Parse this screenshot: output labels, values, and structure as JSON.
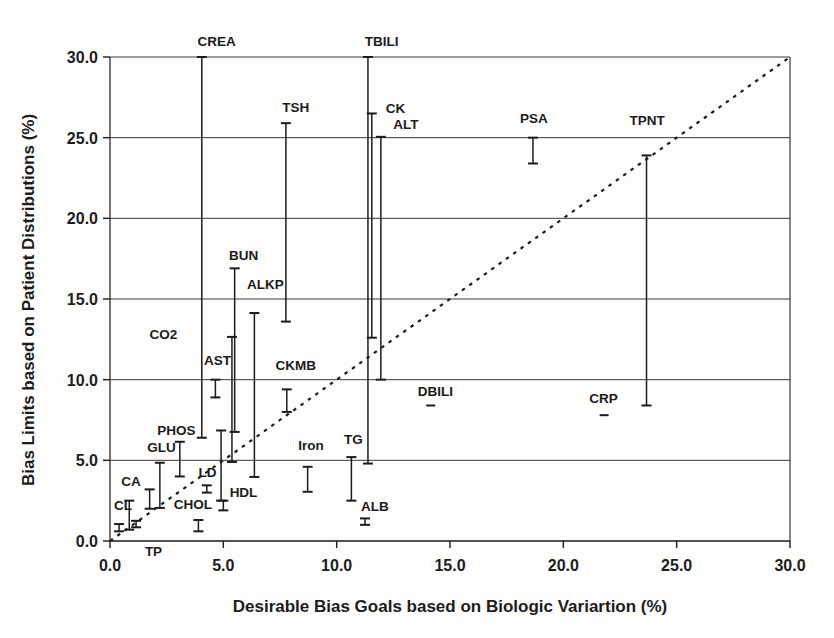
{
  "figure": {
    "background": "#fdfdfc",
    "ink": "#1c1c1c",
    "grid_color": "#3a3a3a"
  },
  "chart_data": {
    "type": "scatter",
    "subtype": "vertical-error-bars",
    "title": "",
    "xlabel": "Desirable Bias Goals based on Biologic Variartion (%)",
    "ylabel": "Bias Limits based on Patient Distributions (%)",
    "xlim": [
      0,
      30
    ],
    "ylim": [
      0,
      30
    ],
    "xtick_values": [
      0,
      5,
      10,
      15,
      20,
      25,
      30
    ],
    "xtick_labels": [
      "0.0",
      "5.0",
      "10.0",
      "15.0",
      "20.0",
      "25.0",
      "30.0"
    ],
    "ytick_values": [
      0,
      5,
      10,
      15,
      20,
      25,
      30
    ],
    "ytick_labels": [
      "0.0",
      "5.0",
      "10.0",
      "15.0",
      "20.0",
      "25.0",
      "30.0"
    ],
    "grid": "horizontal-only",
    "plot_box": true,
    "identity_line": {
      "style": "dashed",
      "from": [
        0,
        0
      ],
      "to": [
        30,
        30
      ]
    },
    "series": [
      {
        "label": "CREA",
        "x": 4.05,
        "y_low": 6.4,
        "y_high": 30.0,
        "label_x": 4.7,
        "label_y": 31.0
      },
      {
        "label": "TBILI",
        "x": 11.38,
        "y_low": 4.8,
        "y_high": 30.0,
        "label_x": 11.98,
        "label_y": 31.0
      },
      {
        "label": "TSH",
        "x": 7.76,
        "y_low": 13.6,
        "y_high": 25.9,
        "label_x": 8.2,
        "label_y": 26.9
      },
      {
        "label": "CK",
        "x": 11.55,
        "y_low": 12.6,
        "y_high": 26.5,
        "label_x": 12.6,
        "label_y": 26.85
      },
      {
        "label": "ALT",
        "x": 11.95,
        "y_low": 10.0,
        "y_high": 25.05,
        "label_x": 13.05,
        "label_y": 25.85
      },
      {
        "label": "PSA",
        "x": 18.66,
        "y_low": 23.4,
        "y_high": 25.0,
        "label_x": 18.7,
        "label_y": 26.2
      },
      {
        "label": "TPNT",
        "x": 23.67,
        "y_low": 8.4,
        "y_high": 23.9,
        "label_x": 23.7,
        "label_y": 26.1
      },
      {
        "label": "BUN",
        "x": 5.5,
        "y_low": 6.76,
        "y_high": 16.9,
        "label_x": 5.9,
        "label_y": 17.75
      },
      {
        "label": "ALKP",
        "x": 6.37,
        "y_low": 3.97,
        "y_high": 14.13,
        "label_x": 6.85,
        "label_y": 15.9
      },
      {
        "label": "AST",
        "x": 5.38,
        "y_low": 4.9,
        "y_high": 12.65,
        "label_x": 4.74,
        "label_y": 11.2
      },
      {
        "label": "CO2",
        "x": 4.65,
        "y_low": 8.9,
        "y_high": 10.0,
        "label_x": 2.36,
        "label_y": 12.8
      },
      {
        "label": "CKMB",
        "x": 7.8,
        "y_low": 8.0,
        "y_high": 9.4,
        "label_x": 8.2,
        "label_y": 10.9
      },
      {
        "label": "DBILI",
        "x": 14.15,
        "y_low": 8.35,
        "y_high": 8.45,
        "label_x": 14.36,
        "label_y": 9.3
      },
      {
        "label": "CRP",
        "x": 21.8,
        "y_low": 7.75,
        "y_high": 7.85,
        "label_x": 21.77,
        "label_y": 8.85
      },
      {
        "label": "PHOS",
        "x": 3.08,
        "y_low": 4.0,
        "y_high": 6.15,
        "label_x": 2.93,
        "label_y": 6.9
      },
      {
        "label": "GLU",
        "x": 2.2,
        "y_low": 2.05,
        "y_high": 4.85,
        "label_x": 2.27,
        "label_y": 5.8
      },
      {
        "label": "Iron",
        "x": 8.72,
        "y_low": 3.05,
        "y_high": 4.6,
        "label_x": 8.87,
        "label_y": 5.95
      },
      {
        "label": "TG",
        "x": 10.65,
        "y_low": 2.5,
        "y_high": 5.2,
        "label_x": 10.74,
        "label_y": 6.3
      },
      {
        "label": "CA",
        "x": 1.75,
        "y_low": 2.0,
        "y_high": 3.2,
        "label_x": 0.93,
        "label_y": 3.75
      },
      {
        "label": "CL",
        "x": 0.85,
        "y_low": 0.7,
        "y_high": 2.5,
        "label_x": 0.57,
        "label_y": 2.26
      },
      {
        "label": "CHOL",
        "x": 3.9,
        "y_low": 0.6,
        "y_high": 1.3,
        "label_x": 3.66,
        "label_y": 2.3
      },
      {
        "label": "LD",
        "x": 4.27,
        "y_low": 3.0,
        "y_high": 3.45,
        "label_x": 4.3,
        "label_y": 4.25
      },
      {
        "label": "HDL",
        "x": 5.0,
        "y_low": 1.9,
        "y_high": 2.5,
        "label_x": 5.89,
        "label_y": 3.05
      },
      {
        "label": "ALB",
        "x": 11.25,
        "y_low": 1.0,
        "y_high": 1.4,
        "label_x": 11.69,
        "label_y": 2.2
      },
      {
        "label": "TP",
        "x": 1.15,
        "y_low": 0.85,
        "y_high": 1.25,
        "label_x": 1.92,
        "label_y": -0.65
      },
      {
        "label": "",
        "x": 4.9,
        "y_low": 2.5,
        "y_high": 6.85,
        "label_x": null,
        "label_y": null
      },
      {
        "label": "",
        "x": 0.4,
        "y_low": 0.6,
        "y_high": 1.05,
        "label_x": null,
        "label_y": null
      }
    ]
  }
}
